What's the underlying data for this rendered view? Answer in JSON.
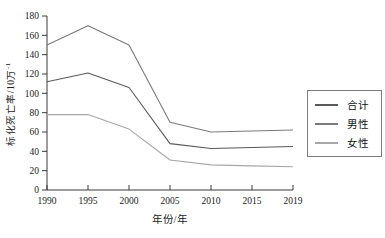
{
  "figure": {
    "background": "#ffffff",
    "axis_color": "#3a3a3a",
    "tick_label_color": "#222222"
  },
  "chart_data": {
    "type": "line",
    "title": "",
    "xlabel": "年份/年",
    "ylabel": "标化死亡率/10万⁻¹",
    "ylabel_main": "标化死亡率/10万",
    "ylabel_sup": "-1",
    "categories": [
      "1990",
      "1995",
      "2000",
      "2005",
      "2010",
      "2015",
      "2019"
    ],
    "ylim": [
      0,
      180
    ],
    "ytick_step": 20,
    "grid": false,
    "legend_position": "right",
    "series": [
      {
        "name": "合计",
        "color": "#595959",
        "values": [
          112,
          121,
          106,
          48,
          43,
          44,
          45
        ]
      },
      {
        "name": "男性",
        "color": "#7a7a7a",
        "values": [
          150,
          170,
          150,
          70,
          60,
          61,
          62
        ]
      },
      {
        "name": "女性",
        "color": "#a6a6a6",
        "values": [
          78,
          78,
          63,
          31,
          26,
          25,
          24
        ]
      }
    ]
  }
}
